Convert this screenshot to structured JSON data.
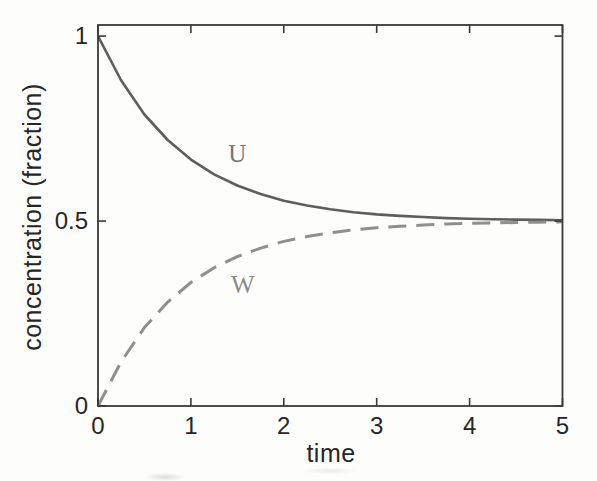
{
  "figure": {
    "kind": "scanned-plot",
    "background_color": "#fdfdfc",
    "axis_color": "#3a3a3a",
    "tick_label_color": "#262626"
  },
  "chart_data": {
    "type": "line",
    "title": "",
    "xlabel": "time",
    "ylabel": "concentration (fraction)",
    "xlim": [
      0,
      5
    ],
    "ylim": [
      0,
      1.03
    ],
    "xticks": [
      0,
      1,
      2,
      3,
      4,
      5
    ],
    "xtick_labels": [
      "0",
      "1",
      "2",
      "3",
      "4",
      "5"
    ],
    "yticks": [
      0,
      0.5,
      1
    ],
    "ytick_labels": [
      "0",
      "0.5",
      "1"
    ],
    "grid": false,
    "legend_position": "inline-curve-labels",
    "x": [
      0,
      0.25,
      0.5,
      0.75,
      1,
      1.25,
      1.5,
      1.75,
      2,
      2.25,
      2.5,
      2.75,
      3,
      3.25,
      3.5,
      3.75,
      4,
      4.25,
      4.5,
      4.75,
      5
    ],
    "series": [
      {
        "name": "U",
        "style": "solid",
        "color": "#5e5e5e",
        "line_width": 2.6,
        "label_color": "#757575",
        "label_pos": {
          "x": 1.5,
          "y": 0.685
        },
        "values": [
          1.0,
          0.88,
          0.788,
          0.719,
          0.666,
          0.626,
          0.596,
          0.573,
          0.555,
          0.542,
          0.532,
          0.524,
          0.518,
          0.514,
          0.511,
          0.508,
          0.506,
          0.505,
          0.504,
          0.503,
          0.502
        ]
      },
      {
        "name": "W",
        "style": "dashed",
        "color": "#8f8f8f",
        "line_width": 3,
        "dash_pattern": "18 10",
        "label_color": "#8a8a8a",
        "label_pos": {
          "x": 1.56,
          "y": 0.329
        },
        "values": [
          0.0,
          0.12,
          0.212,
          0.281,
          0.334,
          0.374,
          0.404,
          0.427,
          0.445,
          0.458,
          0.468,
          0.476,
          0.482,
          0.486,
          0.489,
          0.492,
          0.494,
          0.495,
          0.496,
          0.497,
          0.498
        ]
      }
    ],
    "annotation": "Two curves U (solid) and W (dashed) converge to 0.5 as time increases"
  }
}
